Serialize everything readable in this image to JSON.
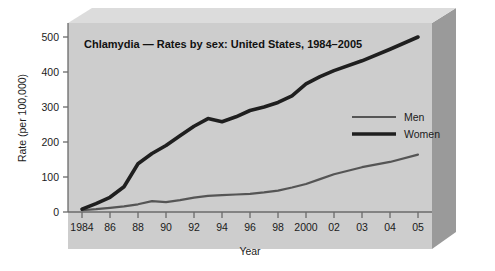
{
  "chart_data": {
    "type": "line",
    "title": "Chlamydia — Rates by sex: United States, 1984–2005",
    "xlabel": "Year",
    "ylabel": "Rate (per 100,000)",
    "ylim": [
      0,
      540
    ],
    "yticks": [
      0,
      100,
      200,
      300,
      400,
      500
    ],
    "ytick_labels": [
      "0",
      "100",
      "200",
      "300",
      "400",
      "500"
    ],
    "xtick_labels": [
      "1984",
      "86",
      "88",
      "90",
      "92",
      "94",
      "96",
      "98",
      "2000",
      "02",
      "03",
      "04",
      "05"
    ],
    "grid": false,
    "legend_position": "center-right",
    "x": [
      "1984",
      "1985",
      "1986",
      "1987",
      "1988",
      "1989",
      "1990",
      "1991",
      "1992",
      "1993",
      "1994",
      "1995",
      "1996",
      "1997",
      "1998",
      "1999",
      "2000",
      "2001",
      "2002",
      "2003",
      "2004",
      "2005"
    ],
    "series": [
      {
        "name": "Men",
        "color": "#555555",
        "line_width": 2.2,
        "values": [
          5,
          8,
          12,
          16,
          22,
          31,
          28,
          34,
          41,
          46,
          48,
          50,
          52,
          56,
          61,
          70,
          80,
          94,
          108,
          128,
          143,
          164
        ]
      },
      {
        "name": "Women",
        "color": "#1f1f1f",
        "line_width": 3.6,
        "values": [
          8,
          24,
          42,
          72,
          138,
          167,
          190,
          218,
          245,
          267,
          258,
          272,
          290,
          300,
          313,
          332,
          366,
          387,
          404,
          432,
          465,
          500
        ]
      }
    ],
    "colors": {
      "plot_background": "#cdcdcd",
      "bevel_top": "#dcdcdc",
      "bevel_side": "#9a9a9a",
      "axis": "#6a6a6a",
      "text": "#1b1b1b",
      "page_background": "#ffffff"
    }
  }
}
